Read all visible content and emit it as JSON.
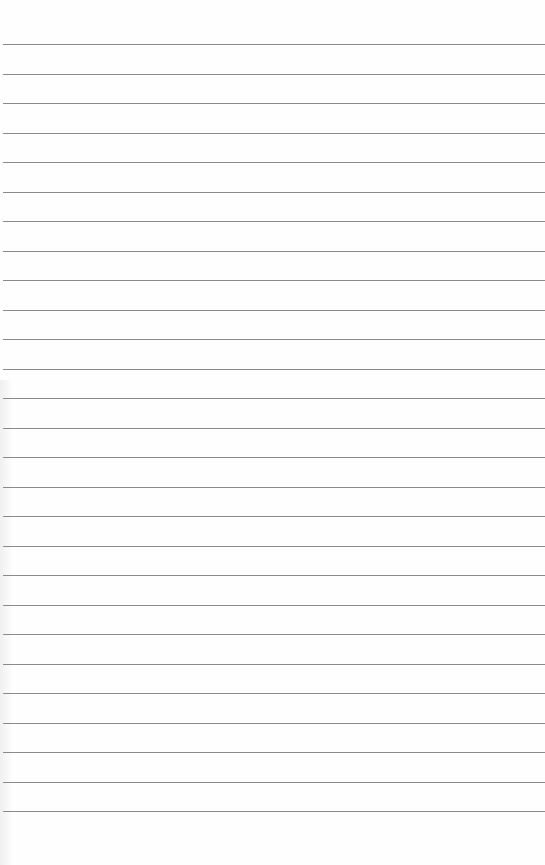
{
  "page": {
    "type": "lined-paper",
    "background_color": "#fefefe",
    "line_color": "#8a8a8a",
    "line_count": 27,
    "first_line_y": 44,
    "line_spacing": 29.5
  }
}
